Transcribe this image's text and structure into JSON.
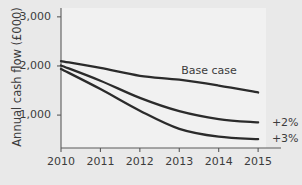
{
  "chart_data": {
    "type": "line",
    "title": "",
    "xlabel": "",
    "ylabel": "Annual cash flow (£000)",
    "x": [
      2010,
      2011,
      2012,
      2013,
      2014,
      2015
    ],
    "xtick_labels": [
      "2010",
      "2011",
      "2012",
      "2013",
      "2014",
      "2015"
    ],
    "ytick_values": [
      1000,
      2000,
      3000
    ],
    "ytick_labels": [
      "1,000",
      "2,000",
      "3,000"
    ],
    "xlim": [
      2010,
      2015.2
    ],
    "ylim": [
      330,
      3180
    ],
    "grid": false,
    "legend_position": "inline-annotations",
    "series": [
      {
        "name": "Base case",
        "label": "Base case",
        "values": [
          2100,
          1960,
          1800,
          1720,
          1600,
          1460
        ],
        "color": "#2b2b2b"
      },
      {
        "name": "+2%",
        "label": "+2%",
        "values": [
          2010,
          1700,
          1350,
          1080,
          920,
          850
        ],
        "color": "#2b2b2b"
      },
      {
        "name": "+3%",
        "label": "+3%",
        "values": [
          1940,
          1530,
          1090,
          720,
          560,
          510
        ],
        "color": "#2b2b2b"
      }
    ],
    "annotations": [
      {
        "text": "Base case",
        "x": 2013.05,
        "y": 1900
      },
      {
        "text": "+2%",
        "x": 2015.35,
        "y": 850
      },
      {
        "text": "+3%",
        "x": 2015.35,
        "y": 510
      }
    ],
    "colors": {
      "figure_background": "#e9e9e9",
      "plot_background": "#f1f1f1",
      "axis": "#5a5a5a",
      "line": "#2b2b2b",
      "text": "#3c3c3c"
    }
  }
}
